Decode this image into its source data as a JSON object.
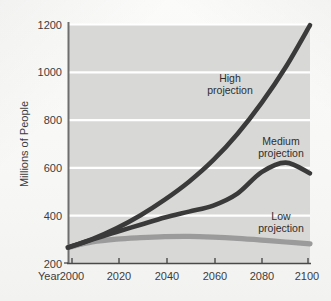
{
  "chart_data": {
    "type": "line",
    "title": "",
    "xlabel": "Year",
    "ylabel": "Millions of People",
    "xlim": [
      2000,
      2100
    ],
    "ylim": [
      200,
      1200
    ],
    "grid": true,
    "legend_position": "inline-annotations",
    "x_ticks": [
      "2000",
      "2020",
      "2040",
      "2060",
      "2080",
      "2100"
    ],
    "y_ticks": [
      "200",
      "400",
      "600",
      "800",
      "1000",
      "1200"
    ],
    "x": [
      2000,
      2010,
      2020,
      2030,
      2040,
      2050,
      2060,
      2070,
      2080,
      2090,
      2100
    ],
    "series": [
      {
        "name": "High projection",
        "color": "#3a3a3a",
        "values": [
          265,
          300,
          345,
          400,
          465,
          540,
          630,
          740,
          870,
          1020,
          1195
        ]
      },
      {
        "name": "Medium projection",
        "color": "#3a3a3a",
        "values": [
          265,
          298,
          330,
          360,
          390,
          415,
          440,
          490,
          580,
          620,
          575
        ]
      },
      {
        "name": "Low projection",
        "color": "#9b9b9b",
        "values": [
          265,
          288,
          300,
          306,
          310,
          311,
          308,
          303,
          296,
          288,
          280
        ]
      }
    ],
    "annotations": [
      {
        "id": "high",
        "lines": [
          "High",
          "projection"
        ],
        "x_px": 230,
        "y_px": 80
      },
      {
        "id": "medium",
        "lines": [
          "Medium",
          "projection"
        ],
        "x_px": 281,
        "y_px": 143
      },
      {
        "id": "low",
        "lines": [
          "Low",
          "projection"
        ],
        "x_px": 281,
        "y_px": 218
      }
    ]
  },
  "axes": {
    "year_label": "Year",
    "y_axis_title": "Millions of People"
  },
  "colors": {
    "plot_background": "#d8d8d6",
    "gridline": "#ffffff",
    "axis_line": "#6e6e6e",
    "dark_curve": "#3a3a3a",
    "light_curve": "#9b9b9b",
    "text": "#3c3c3c",
    "page_background": "#fdfdfd"
  }
}
